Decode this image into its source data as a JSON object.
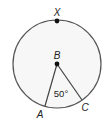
{
  "diagram": {
    "type": "circle-central-angle",
    "circle": {
      "cx": 57,
      "cy": 64,
      "r": 44,
      "stroke": "#555555",
      "fill": "#f7f7f7"
    },
    "points": {
      "X": {
        "label": "X",
        "x": 57,
        "y": 21
      },
      "B": {
        "label": "B",
        "x": 57,
        "y": 64
      },
      "A": {
        "label": "A",
        "x": 45,
        "y": 106
      },
      "C": {
        "label": "C",
        "x": 82,
        "y": 100
      }
    },
    "angle": {
      "label": "50°",
      "vertex": "B",
      "value": 50
    }
  }
}
